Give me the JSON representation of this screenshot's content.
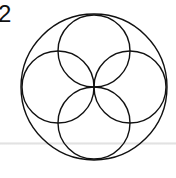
{
  "figure": {
    "label": "2",
    "stroke_color": "#111111",
    "background": "#ffffff",
    "outer_circle": {
      "cx": 94,
      "cy": 87,
      "r": 73
    },
    "inner_circles": [
      {
        "name": "top",
        "cx": 94,
        "cy": 51,
        "r": 36
      },
      {
        "name": "right",
        "cx": 130,
        "cy": 87,
        "r": 36
      },
      {
        "name": "bottom",
        "cx": 94,
        "cy": 123,
        "r": 36
      },
      {
        "name": "left",
        "cx": 58,
        "cy": 87,
        "r": 36
      }
    ]
  }
}
